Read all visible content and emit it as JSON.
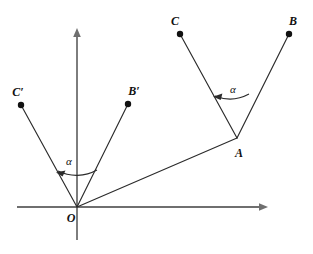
{
  "figure": {
    "type": "geometry-diagram",
    "canvas": {
      "width": 313,
      "height": 254,
      "background": "#ffffff"
    },
    "colors": {
      "axis": "#6f6f6f",
      "ray": "#2b2b2b",
      "point": "#111111",
      "label": "#111111",
      "arc": "#2b2b2b"
    },
    "axes": {
      "x_axis": {
        "name": "x-axis",
        "x1": 17,
        "y1": 207,
        "x2": 268,
        "y2": 207,
        "arrow": "right"
      },
      "y_axis": {
        "name": "y-axis",
        "x1": 77,
        "y1": 240,
        "x2": 77,
        "y2": 28,
        "arrow": "up"
      }
    },
    "points": [
      {
        "id": "O",
        "label": "O",
        "x": 77,
        "y": 207,
        "label_x": 71,
        "label_y": 218,
        "dot": false
      },
      {
        "id": "A",
        "label": "A",
        "x": 237,
        "y": 138,
        "label_x": 239,
        "label_y": 153,
        "dot": false
      },
      {
        "id": "B",
        "label": "B",
        "x": 289,
        "y": 34,
        "label_x": 293,
        "label_y": 21,
        "dot": true
      },
      {
        "id": "C",
        "label": "C",
        "x": 180,
        "y": 34,
        "label_x": 175,
        "label_y": 21,
        "dot": true
      },
      {
        "id": "Bp",
        "label": "B′",
        "x": 128,
        "y": 104,
        "label_x": 134,
        "label_y": 91,
        "dot": true
      },
      {
        "id": "Cp",
        "label": "C′",
        "x": 21,
        "y": 105,
        "label_x": 18,
        "label_y": 92,
        "dot": true
      }
    ],
    "segments": [
      {
        "name": "segment-O-Cprime",
        "from": "O",
        "to": "Cp"
      },
      {
        "name": "segment-O-Bprime",
        "from": "O",
        "to": "Bp"
      },
      {
        "name": "segment-O-A",
        "from": "O",
        "to": "A"
      },
      {
        "name": "segment-A-C",
        "from": "A",
        "to": "C"
      },
      {
        "name": "segment-A-B",
        "from": "A",
        "to": "B"
      }
    ],
    "angles": [
      {
        "name": "angle-at-origin",
        "label": "α",
        "vertex": "O",
        "label_x": 69,
        "label_y": 161,
        "arc_path": "M 97 170 A 42 42 0 0 1 58 171",
        "arrow_tip": {
          "x": 58,
          "y": 171
        },
        "arrow_dir": -118
      },
      {
        "name": "angle-at-A",
        "label": "α",
        "vertex": "A",
        "label_x": 233,
        "label_y": 89,
        "arc_path": "M 249 94 A 40 40 0 0 1 215 96",
        "arrow_tip": {
          "x": 215,
          "y": 96
        },
        "arrow_dir": -152
      }
    ],
    "dot_radius": 3.1,
    "stroke_width_ray": 1.1,
    "stroke_width_axis": 1.6,
    "stroke_width_arc": 1.1
  }
}
